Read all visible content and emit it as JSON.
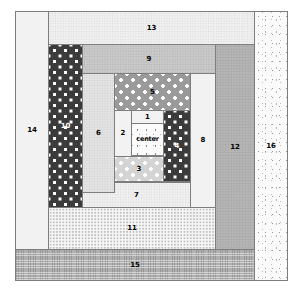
{
  "diagram": {
    "type": "log-cabin-quilt-block",
    "canvas": {
      "width": 301,
      "height": 292,
      "background": "#ffffff"
    },
    "outline": {
      "x": 15,
      "y": 11,
      "width": 273,
      "height": 270,
      "stroke": "#7d7d7d"
    },
    "pieces": [
      {
        "id": "center",
        "label": "center",
        "fabric": "speckled-white",
        "color": "#fbfbfb",
        "label_color": "#000000",
        "x": 131,
        "y": 123,
        "width": 33,
        "height": 33
      },
      {
        "id": "1",
        "label": "1",
        "fabric": "plain-very-light",
        "color": "#f2f2f2",
        "label_color": "#000000",
        "x": 131,
        "y": 110,
        "width": 33,
        "height": 14
      },
      {
        "id": "2",
        "label": "2",
        "fabric": "plain-very-light",
        "color": "#f2f2f2",
        "label_color": "#000000",
        "x": 114,
        "y": 110,
        "width": 18,
        "height": 47
      },
      {
        "id": "3",
        "label": "3",
        "fabric": "polka-light",
        "color": "#d4d4d4",
        "label_color": "#000000",
        "x": 114,
        "y": 156,
        "width": 50,
        "height": 26
      },
      {
        "id": "4",
        "label": "4",
        "fabric": "polka-dark",
        "color": "#3b3b3b",
        "label_color": "#ffffff",
        "x": 163,
        "y": 110,
        "width": 28,
        "height": 72
      },
      {
        "id": "5",
        "label": "5",
        "fabric": "polka-mid",
        "color": "#9a9a9a",
        "label_color": "#000000",
        "x": 114,
        "y": 73,
        "width": 77,
        "height": 38
      },
      {
        "id": "6",
        "label": "6",
        "fabric": "dotgrid-light",
        "color": "#e2e2e2",
        "label_color": "#000000",
        "x": 82,
        "y": 73,
        "width": 33,
        "height": 120
      },
      {
        "id": "7",
        "label": "7",
        "fabric": "dotgrid-vlight",
        "color": "#efefef",
        "label_color": "#000000",
        "x": 82,
        "y": 182,
        "width": 109,
        "height": 26
      },
      {
        "id": "8",
        "label": "8",
        "fabric": "plain-very-light",
        "color": "#f2f2f2",
        "label_color": "#000000",
        "x": 190,
        "y": 73,
        "width": 26,
        "height": 135
      },
      {
        "id": "9",
        "label": "9",
        "fabric": "dotgrid-mid",
        "color": "#c8c8c8",
        "label_color": "#000000",
        "x": 82,
        "y": 44,
        "width": 134,
        "height": 30
      },
      {
        "id": "10",
        "label": "10",
        "fabric": "polka-dark",
        "color": "#3b3b3b",
        "label_color": "#ffffff",
        "x": 48,
        "y": 44,
        "width": 35,
        "height": 164
      },
      {
        "id": "11",
        "label": "11",
        "fabric": "dot-white",
        "color": "#f4f4f4",
        "label_color": "#000000",
        "x": 48,
        "y": 207,
        "width": 168,
        "height": 43
      },
      {
        "id": "12",
        "label": "12",
        "fabric": "dotgrid-grey",
        "color": "#b4b4b4",
        "label_color": "#000000",
        "x": 215,
        "y": 44,
        "width": 40,
        "height": 206
      },
      {
        "id": "13",
        "label": "13",
        "fabric": "dotgrid-vlight",
        "color": "#efefef",
        "label_color": "#000000",
        "x": 48,
        "y": 11,
        "width": 207,
        "height": 34
      },
      {
        "id": "14",
        "label": "14",
        "fabric": "plain-very-light",
        "color": "#f2f2f2",
        "label_color": "#000000",
        "x": 15,
        "y": 11,
        "width": 34,
        "height": 239
      },
      {
        "id": "15",
        "label": "15",
        "fabric": "weave-grey",
        "color": "#b0b0b0",
        "label_color": "#000000",
        "x": 15,
        "y": 249,
        "width": 240,
        "height": 32
      },
      {
        "id": "16",
        "label": "16",
        "fabric": "scatter-white",
        "color": "#fafafa",
        "label_color": "#000000",
        "x": 254,
        "y": 11,
        "width": 34,
        "height": 270
      }
    ]
  }
}
